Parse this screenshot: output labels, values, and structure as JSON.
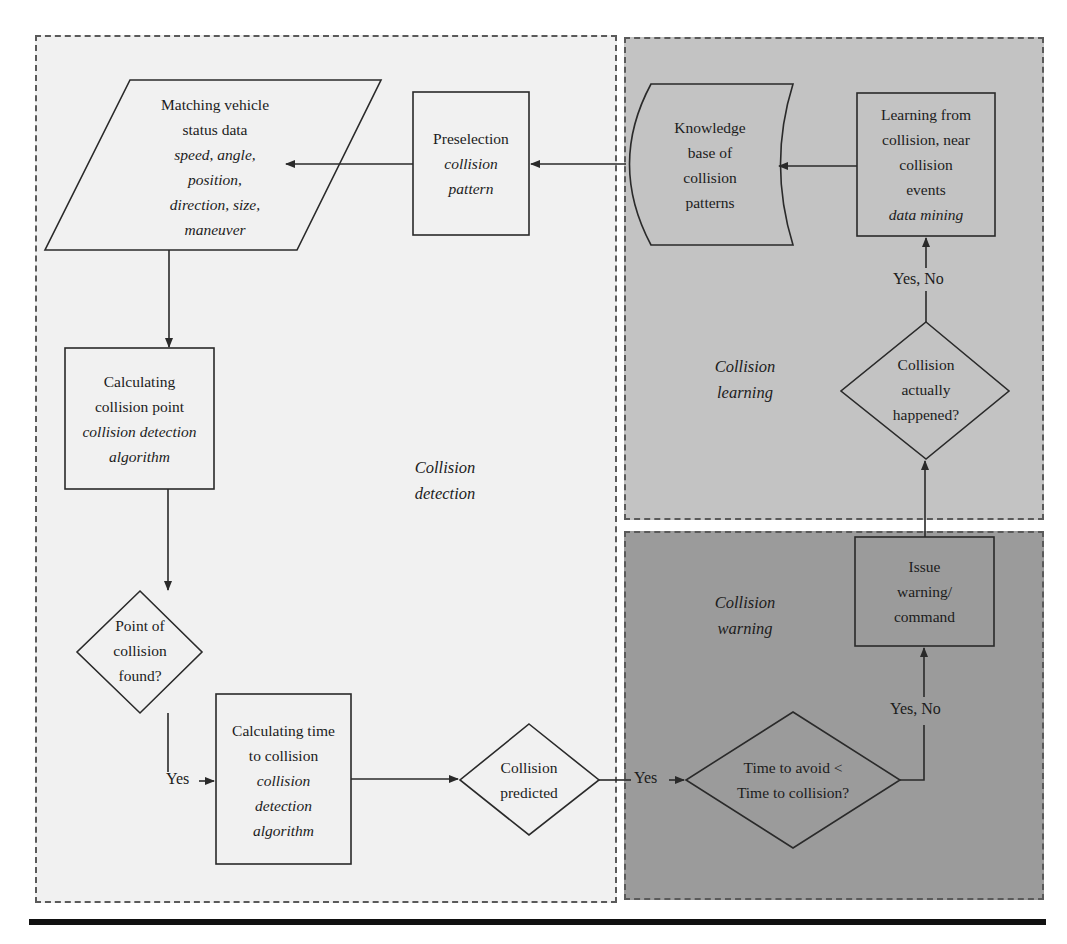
{
  "regions": {
    "detection": {
      "label_line1": "Collision",
      "label_line2": "detection",
      "fill": "#f1f1f1"
    },
    "learning": {
      "label_line1": "Collision",
      "label_line2": "learning",
      "fill": "#c3c3c3"
    },
    "warning": {
      "label_line1": "Collision",
      "label_line2": "warning",
      "fill": "#9b9b9b"
    }
  },
  "nodes": {
    "matching_vehicle": {
      "shape": "parallelogram",
      "title_line1": "Matching vehicle",
      "title_line2": "status data",
      "detail_line1": "speed, angle,",
      "detail_line2": "position,",
      "detail_line3": "direction, size,",
      "detail_line4": "maneuver"
    },
    "preselection": {
      "shape": "rectangle",
      "title_line1": "Preselection",
      "detail_line1": "collision",
      "detail_line2": "pattern"
    },
    "knowledge_base": {
      "shape": "stored-data",
      "title_line1": "Knowledge",
      "title_line2": "base of",
      "title_line3": "collision",
      "title_line4": "patterns"
    },
    "learning_from_collision": {
      "shape": "rectangle",
      "title_line1": "Learning from",
      "title_line2": "collision, near",
      "title_line3": "collision",
      "title_line4": "events",
      "detail_line1": "data mining"
    },
    "calc_collision_point": {
      "shape": "rectangle",
      "title_line1": "Calculating",
      "title_line2": "collision point",
      "detail_line1": "collision detection",
      "detail_line2": "algorithm"
    },
    "point_found": {
      "shape": "diamond",
      "title_line1": "Point of",
      "title_line2": "collision",
      "title_line3": "found?"
    },
    "calc_time": {
      "shape": "rectangle",
      "title_line1": "Calculating time",
      "title_line2": "to collision",
      "detail_line1": "collision",
      "detail_line2": "detection",
      "detail_line3": "algorithm"
    },
    "collision_predicted": {
      "shape": "diamond",
      "title_line1": "Collision",
      "title_line2": "predicted"
    },
    "time_to_avoid": {
      "shape": "diamond",
      "title_line1": "Time to avoid <",
      "title_line2": "Time to collision?"
    },
    "issue_warning": {
      "shape": "rectangle",
      "title_line1": "Issue",
      "title_line2": "warning/",
      "title_line3": "command"
    },
    "actually_happened": {
      "shape": "diamond",
      "title_line1": "Collision",
      "title_line2": "actually",
      "title_line3": "happened?"
    }
  },
  "edges": {
    "found_to_time": "Yes",
    "predicted_to_avoid": "Yes",
    "avoid_to_issue": "Yes, No",
    "happened_to_learning": "Yes, No"
  },
  "colors": {
    "stroke": "#2a2a2a",
    "panel_border": "#5a5a5a",
    "rule": "#111111"
  }
}
